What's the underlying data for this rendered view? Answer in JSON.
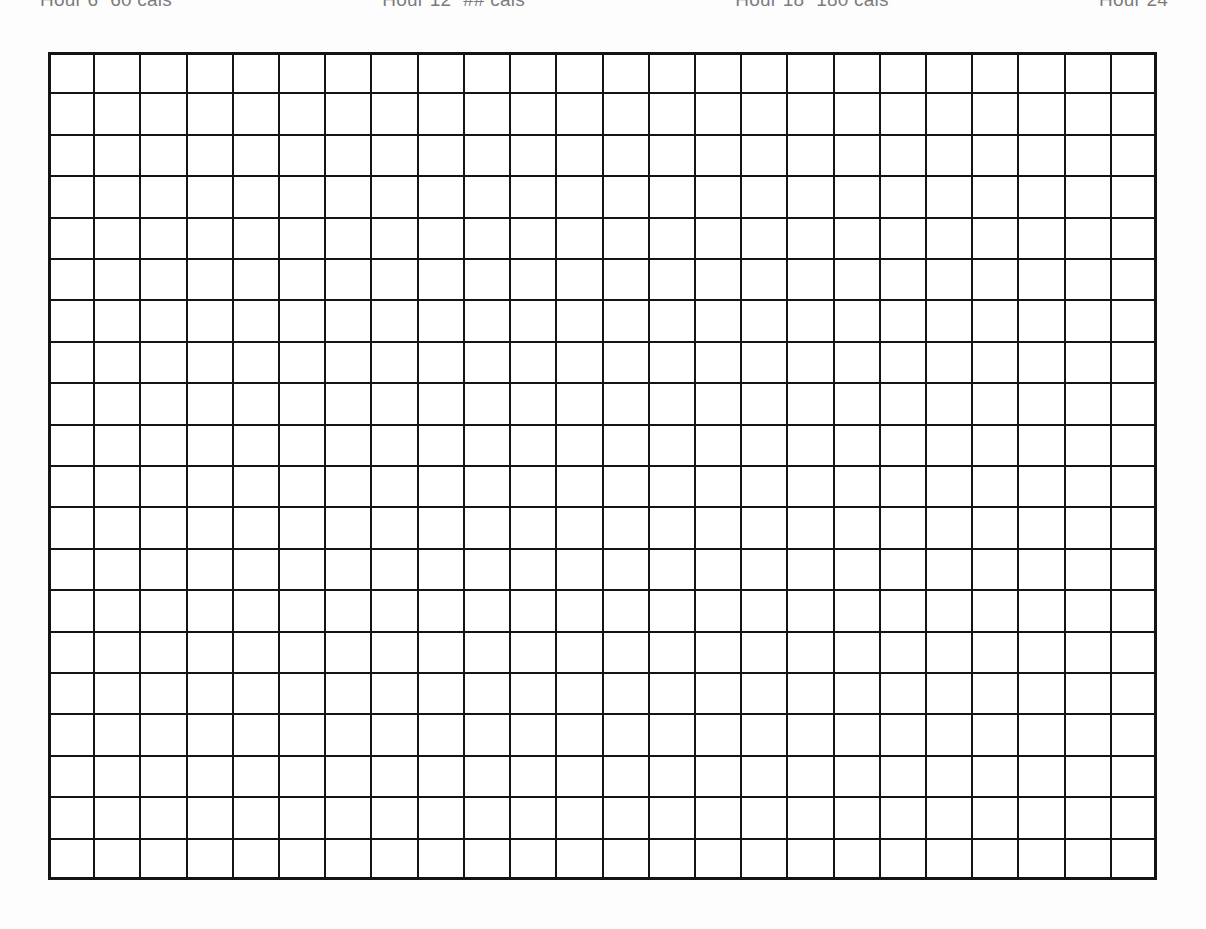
{
  "page": {
    "background_color": "#fdfdfd",
    "ink_color": "#141414",
    "document_type": "printed grid worksheet",
    "width": 1206,
    "height": 929
  },
  "header": {
    "note": "text row is clipped by the top edge of the image; only glyph fragments are visible",
    "items": [
      {
        "label": "Hour 6",
        "value": "60 cals"
      },
      {
        "label": "Hour 12",
        "value": "## cals"
      },
      {
        "label": "Hour 18",
        "value": "180 cals"
      },
      {
        "label": "Hour 24",
        "value": ""
      }
    ]
  },
  "grid": {
    "columns": 24,
    "rows": 20,
    "cell_width": 46,
    "cell_height": 41,
    "line_color": "#141414",
    "line_width": 2,
    "outer_line_width": 3,
    "fill_color": "#ffffff",
    "left": 48,
    "top": 52,
    "width": 1109,
    "height": 828,
    "cells_total": 480,
    "cells_filled": 0
  }
}
